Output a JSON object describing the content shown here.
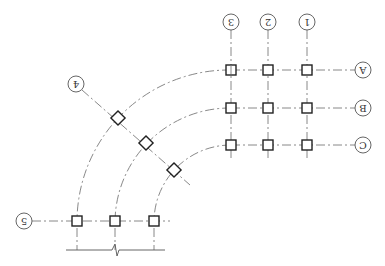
{
  "drawing": {
    "type": "structural axis grid plan (rotated 180°)",
    "orientation_deg": 180,
    "colors": {
      "axis_line": "#7a7a7a",
      "column": "#222222",
      "bubble": "#555555"
    },
    "straight_grid": {
      "columns": [
        {
          "label": "1",
          "x": 307
        },
        {
          "label": "2",
          "x": 268
        },
        {
          "label": "3",
          "x": 231
        }
      ],
      "rows": [
        {
          "label": "A",
          "y": 70
        },
        {
          "label": "B",
          "y": 108
        },
        {
          "label": "C",
          "y": 145
        }
      ]
    },
    "radial_axes": [
      {
        "label": "4",
        "angle_deg": 45
      },
      {
        "label": "5",
        "angle_deg": 90
      }
    ],
    "arc_center": {
      "x": 231,
      "y": 221
    },
    "arc_radii": [
      154,
      116,
      77
    ],
    "bubbles": {
      "1": "1",
      "2": "2",
      "3": "3",
      "A": "A",
      "B": "B",
      "C": "C",
      "4": "4",
      "5": "5"
    },
    "dimension_line": {
      "y": 250,
      "x_start": 66,
      "x_end": 165,
      "has_break_symbol": true
    }
  }
}
